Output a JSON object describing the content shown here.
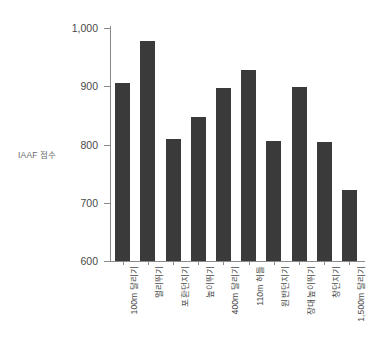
{
  "chart_data": {
    "type": "bar",
    "title": "",
    "subtitle": "",
    "xlabel": "",
    "ylabel": "IAAF 점수",
    "ylim": [
      600,
      1000
    ],
    "ytick_labels": [
      "600",
      "700",
      "800",
      "900",
      "1,000"
    ],
    "ytick_values": [
      600,
      700,
      800,
      900,
      1000
    ],
    "grid": false,
    "legend": false,
    "bar_color": "#3a3a3a",
    "categories": [
      "100m 달리기",
      "멀리뛰기",
      "포환던지기",
      "높이뛰기",
      "400m 달리기",
      "110m 허들",
      "원반던지기",
      "장대높이뛰기",
      "창던지기",
      "1,500m 달리기"
    ],
    "values": [
      906,
      978,
      809,
      847,
      897,
      928,
      806,
      899,
      804,
      722
    ],
    "series": [
      {
        "name": "IAAF 점수",
        "values": [
          906,
          978,
          809,
          847,
          897,
          928,
          806,
          899,
          804,
          722
        ]
      }
    ]
  }
}
